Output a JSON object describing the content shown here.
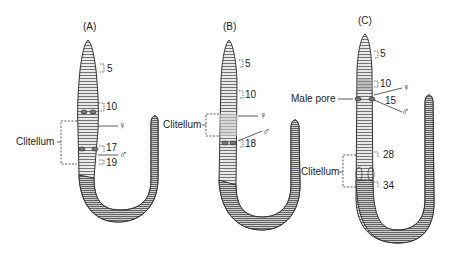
{
  "figure": {
    "panels": [
      {
        "id": "A",
        "label": "(A)",
        "segment_numbers": [
          "5",
          "10",
          "17",
          "19"
        ],
        "clitellum_label": "Clitellum",
        "female_symbol": "♀",
        "male_symbol": "♂"
      },
      {
        "id": "B",
        "label": "(B)",
        "segment_numbers": [
          "5",
          "10",
          "18"
        ],
        "clitellum_label": "Clitellum",
        "female_symbol": "♀",
        "male_symbol": "♂"
      },
      {
        "id": "C",
        "label": "(C)",
        "segment_numbers": [
          "5",
          "10",
          "15",
          "28",
          "34"
        ],
        "clitellum_label": "Clitellum",
        "male_pore_label": "Male pore",
        "female_symbol": "♀",
        "male_symbol": "♂"
      }
    ]
  }
}
